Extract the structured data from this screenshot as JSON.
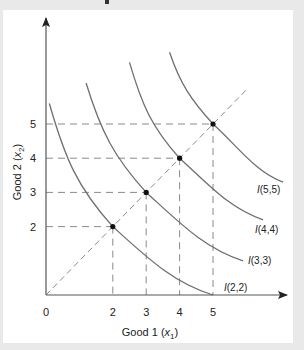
{
  "chart_data": {
    "type": "line",
    "title": "",
    "xlabel": "Good 1 (x1)",
    "ylabel": "Good 2 (x2)",
    "xlabel_parts": {
      "pre": "Good 1 (",
      "var": "x",
      "sub": "1",
      "post": ")"
    },
    "ylabel_parts": {
      "pre": "Good 2 (",
      "var": "x",
      "sub": "2",
      "post": ")"
    },
    "origin_label": "0",
    "x_ticks": [
      2,
      3,
      4,
      5
    ],
    "y_ticks": [
      2,
      3,
      4,
      5
    ],
    "xlim": [
      0,
      7.2
    ],
    "ylim": [
      0,
      8
    ],
    "grid": false,
    "diagonal": {
      "from": [
        0,
        0
      ],
      "to": [
        6,
        6
      ],
      "style": "dashed"
    },
    "points": [
      [
        2,
        2
      ],
      [
        3,
        3
      ],
      [
        4,
        4
      ],
      [
        5,
        5
      ]
    ],
    "series": [
      {
        "name": "I(2,2)",
        "label_italic": "I",
        "label_rest": "(2,2)",
        "start": [
          0.1,
          5.6
        ],
        "through": [
          2,
          2
        ],
        "end": [
          5,
          0
        ]
      },
      {
        "name": "I(3,3)",
        "label_italic": "I",
        "label_rest": "(3,3)",
        "start": [
          1.2,
          6.2
        ],
        "through": [
          3,
          3
        ],
        "end": [
          5.9,
          1.0
        ]
      },
      {
        "name": "I(4,4)",
        "label_italic": "I",
        "label_rest": "(4,4)",
        "start": [
          2.5,
          6.8
        ],
        "through": [
          4,
          4
        ],
        "end": [
          6.5,
          2.2
        ]
      },
      {
        "name": "I(5,5)",
        "label_italic": "I",
        "label_rest": "(5,5)",
        "start": [
          3.7,
          7.1
        ],
        "through": [
          5,
          5
        ],
        "end": [
          7.1,
          3.3
        ]
      }
    ]
  },
  "colors": {
    "curve": "#6f6f6f",
    "dash": "#8a8a8a",
    "axis": "#555555",
    "point": "#111111",
    "background": "#ffffff",
    "frame": "#e9e9e9"
  }
}
